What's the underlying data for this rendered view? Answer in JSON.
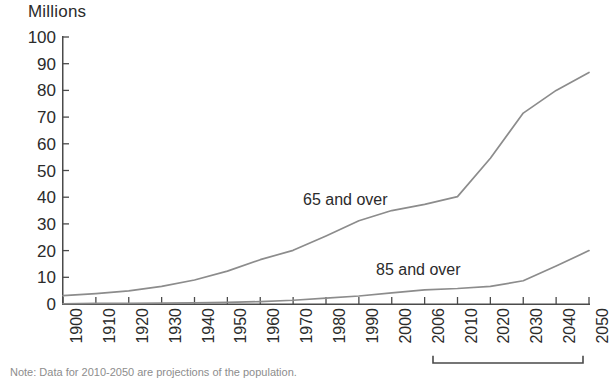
{
  "chart_data": {
    "type": "line",
    "title": "",
    "subtitle": "",
    "unit_label": "Millions",
    "xlabel": "",
    "ylabel": "Millions",
    "ylim": [
      0,
      100
    ],
    "ytick_step": 10,
    "ytick_labels": [
      "100",
      "90",
      "80",
      "70",
      "60",
      "50",
      "40",
      "30",
      "20",
      "10",
      "0"
    ],
    "ytick_values": [
      100,
      90,
      80,
      70,
      60,
      50,
      40,
      30,
      20,
      10,
      0
    ],
    "grid": false,
    "legend_position": "inline-annotation",
    "x": [
      1900,
      1910,
      1920,
      1930,
      1940,
      1950,
      1960,
      1970,
      1980,
      1990,
      2000,
      2006,
      2010,
      2020,
      2030,
      2040,
      2050
    ],
    "xtick_labels": [
      "1900",
      "1910",
      "1920",
      "1930",
      "1940",
      "1950",
      "1960",
      "1970",
      "1980",
      "1990",
      "2000",
      "2006",
      "2010",
      "2020",
      "2030",
      "2040",
      "2050"
    ],
    "series": [
      {
        "name": "65 and over",
        "color": "#8c8c8c",
        "values": [
          3.1,
          3.9,
          4.9,
          6.6,
          9.0,
          12.3,
          16.6,
          20.1,
          25.5,
          31.2,
          35.0,
          37.3,
          40.2,
          54.6,
          71.5,
          80.0,
          86.7
        ]
      },
      {
        "name": "85 and over",
        "color": "#8c8c8c",
        "values": [
          0.1,
          0.2,
          0.2,
          0.3,
          0.4,
          0.6,
          0.9,
          1.4,
          2.2,
          3.0,
          4.2,
          5.3,
          5.8,
          6.6,
          8.7,
          14.2,
          20.0
        ]
      }
    ],
    "annotations": [
      {
        "text": "65 and over",
        "series": "65 and over"
      },
      {
        "text": "85 and over",
        "series": "85 and over"
      }
    ],
    "projection_bracket": {
      "from": "2010",
      "to": "2050"
    },
    "footnote": "Note: Data for 2010-2050 are projections of the population."
  },
  "axis": {
    "unit_label": "Millions"
  },
  "footnote": {
    "text": "Note: Data for 2010-2050 are projections of the population."
  },
  "colors": {
    "line": "#8c8c8c",
    "axis": "#4a4a4a",
    "text": "#2b2b2b",
    "footnote": "#8d8d8d"
  }
}
